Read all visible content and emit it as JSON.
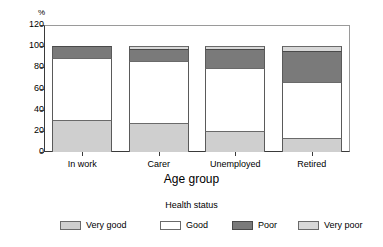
{
  "chart_data": {
    "type": "bar",
    "stacked": true,
    "stacked_mode": "absolute",
    "title": "",
    "xlabel": "Age group",
    "ylabel": "%",
    "ylim": [
      0,
      120
    ],
    "yticks": [
      0,
      20,
      40,
      60,
      80,
      100,
      120
    ],
    "ytick_labels": [
      "0",
      "20",
      "40",
      "60",
      "80",
      "100",
      "120"
    ],
    "grid": false,
    "legend_title": "Health status",
    "legend_position": "bottom",
    "categories": [
      "In work",
      "Carer",
      "Unemployed",
      "Retired"
    ],
    "series": [
      {
        "name": "Very good",
        "color": "#cfcfcf",
        "values": [
          30,
          27,
          20,
          13
        ]
      },
      {
        "name": "Good",
        "color": "#ffffff",
        "values": [
          59,
          59,
          59,
          53
        ]
      },
      {
        "name": "Poor",
        "color": "#7a7a7a",
        "values": [
          11,
          11,
          18,
          29
        ]
      },
      {
        "name": "Very poor",
        "color": "#d8d8d8",
        "values": [
          0,
          3,
          3,
          5
        ]
      }
    ],
    "totals": [
      100,
      100,
      100,
      100
    ]
  },
  "axes": {
    "y_unit_label": "%",
    "x_title": "Age group"
  },
  "legend": {
    "title": "Health status",
    "items": [
      {
        "label": "Very good",
        "swatch": "verygood"
      },
      {
        "label": "Good",
        "swatch": "good"
      },
      {
        "label": "Poor",
        "swatch": "poor"
      },
      {
        "label": "Very poor",
        "swatch": "verypoor"
      }
    ]
  },
  "colors": {
    "very_good": "#cfcfcf",
    "good": "#ffffff",
    "poor": "#7a7a7a",
    "very_poor": "#d8d8d8",
    "axis": "#3a3a3a",
    "frame": "#9a9a9a",
    "text": "#000000",
    "background": "#ffffff"
  }
}
